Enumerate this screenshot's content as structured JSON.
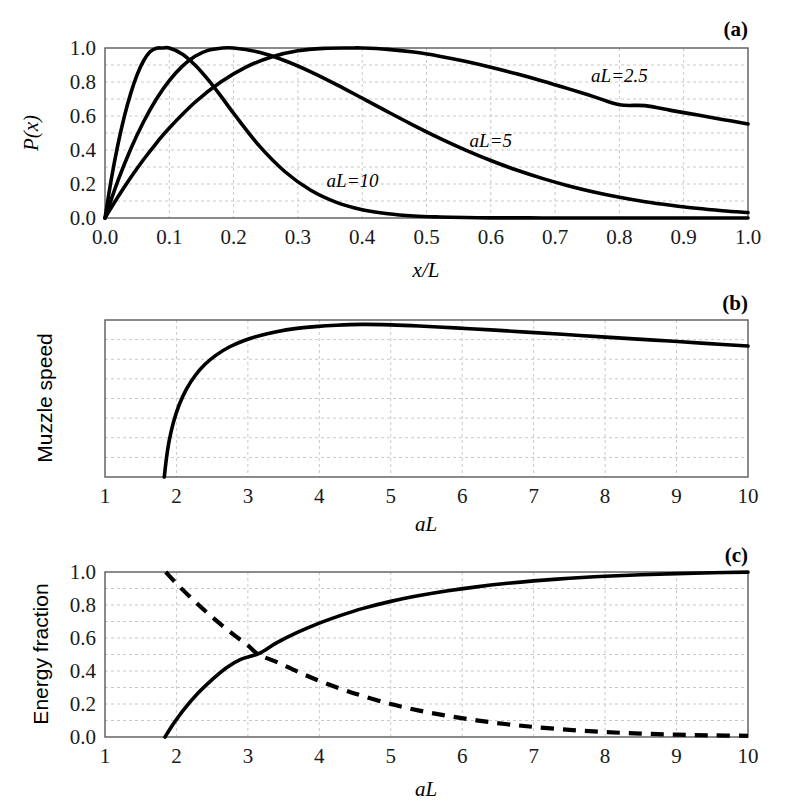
{
  "figure": {
    "title": "",
    "panel_count": 3,
    "background": "#ffffff",
    "curve_color": "#000000",
    "grid_color": "#c9c9c9",
    "frame_color": "#5a5a5a"
  },
  "panels": {
    "a": {
      "label": "(a)",
      "xlabel": "x/L",
      "ylabel": "P(x)",
      "curve_labels": [
        {
          "text": "aL=2.5",
          "x": 0.8,
          "y": 0.8
        },
        {
          "text": "aL=5",
          "x": 0.6,
          "y": 0.42
        },
        {
          "text": "aL=10",
          "x": 0.385,
          "y": 0.185
        }
      ]
    },
    "b": {
      "label": "(b)",
      "xlabel": "aL",
      "ylabel": "Muzzle speed"
    },
    "c": {
      "label": "(c)",
      "xlabel": "aL",
      "ylabel": "Energy fraction"
    }
  },
  "chart_data": [
    {
      "panel": "a",
      "type": "line",
      "title": "(a)",
      "xlabel": "x/L",
      "ylabel": "P(x)",
      "xlim": [
        0.0,
        1.0
      ],
      "ylim": [
        0.0,
        1.0
      ],
      "xticks": [
        0.0,
        0.1,
        0.2,
        0.3,
        0.4,
        0.5,
        0.6,
        0.7,
        0.8,
        0.9,
        1.0
      ],
      "xtick_labels": [
        "0.0",
        "0.1",
        "0.2",
        "0.3",
        "0.4",
        "0.5",
        "0.6",
        "0.7",
        "0.8",
        "0.9",
        "1.0"
      ],
      "yticks": [
        0.0,
        0.2,
        0.4,
        0.6,
        0.8,
        1.0
      ],
      "ytick_labels": [
        "0.0",
        "0.2",
        "0.4",
        "0.6",
        "0.8",
        "1.0"
      ],
      "grid": true,
      "grid_x_step": 0.1,
      "grid_y_step": 0.1,
      "legend": "inline-annotations",
      "series": [
        {
          "name": "aL=2.5",
          "peak_x": 0.4,
          "peak_y": 1.0,
          "x": [
            0.0,
            0.02,
            0.04,
            0.06,
            0.08,
            0.1,
            0.14,
            0.18,
            0.22,
            0.26,
            0.3,
            0.34,
            0.38,
            0.4,
            0.44,
            0.48,
            0.52,
            0.56,
            0.6,
            0.64,
            0.68,
            0.72,
            0.76,
            0.8,
            0.84,
            0.88,
            0.92,
            0.96,
            1.0
          ],
          "y": [
            0.0,
            0.123,
            0.238,
            0.344,
            0.441,
            0.53,
            0.681,
            0.8,
            0.889,
            0.949,
            0.984,
            0.998,
            1.0,
            1.0,
            0.992,
            0.976,
            0.952,
            0.922,
            0.887,
            0.848,
            0.806,
            0.761,
            0.714,
            0.666,
            0.661,
            0.633,
            0.607,
            0.58,
            0.553
          ]
        },
        {
          "name": "aL=5",
          "peak_x": 0.2,
          "peak_y": 1.0,
          "x": [
            0.0,
            0.02,
            0.04,
            0.06,
            0.08,
            0.1,
            0.12,
            0.14,
            0.16,
            0.18,
            0.2,
            0.24,
            0.28,
            0.32,
            0.36,
            0.4,
            0.44,
            0.48,
            0.52,
            0.56,
            0.6,
            0.64,
            0.68,
            0.72,
            0.76,
            0.8,
            0.84,
            0.88,
            0.92,
            0.96,
            1.0
          ],
          "y": [
            0.0,
            0.218,
            0.406,
            0.566,
            0.7,
            0.808,
            0.892,
            0.951,
            0.986,
            0.999,
            1.0,
            0.975,
            0.925,
            0.86,
            0.785,
            0.705,
            0.624,
            0.545,
            0.47,
            0.401,
            0.338,
            0.282,
            0.233,
            0.19,
            0.153,
            0.122,
            0.096,
            0.075,
            0.057,
            0.043,
            0.032
          ]
        },
        {
          "name": "aL=10",
          "peak_x": 0.1,
          "peak_y": 1.0,
          "x": [
            0.0,
            0.01,
            0.02,
            0.03,
            0.04,
            0.05,
            0.06,
            0.07,
            0.08,
            0.09,
            0.1,
            0.12,
            0.14,
            0.16,
            0.18,
            0.2,
            0.24,
            0.28,
            0.32,
            0.36,
            0.4,
            0.44,
            0.48,
            0.52,
            0.56,
            0.6,
            0.64,
            0.68,
            0.72,
            0.76,
            0.8,
            0.86,
            0.92,
            1.0
          ],
          "y": [
            0.0,
            0.232,
            0.43,
            0.596,
            0.733,
            0.843,
            0.925,
            0.978,
            0.999,
            1.0,
            1.0,
            0.965,
            0.9,
            0.815,
            0.718,
            0.616,
            0.424,
            0.272,
            0.163,
            0.092,
            0.049,
            0.025,
            0.012,
            0.006,
            0.003,
            0.001,
            0.001,
            0.0,
            0.0,
            0.0,
            0.0,
            0.0,
            0.0,
            0.0
          ]
        }
      ]
    },
    {
      "panel": "b",
      "type": "line",
      "title": "(b)",
      "xlabel": "aL",
      "ylabel": "Muzzle speed",
      "xlim": [
        1,
        10
      ],
      "ylim": [
        0,
        1
      ],
      "xticks": [
        1,
        2,
        3,
        4,
        5,
        6,
        7,
        8,
        9,
        10
      ],
      "xtick_labels": [
        "1",
        "2",
        "3",
        "4",
        "5",
        "6",
        "7",
        "8",
        "9",
        "10"
      ],
      "yticks": [],
      "ytick_labels": [],
      "grid": true,
      "grid_x_step": 1,
      "grid_y_count": 7,
      "series": [
        {
          "name": "muzzle-speed",
          "x_start": 1.83,
          "peak_x": 4.6,
          "x": [
            1.83,
            1.86,
            1.9,
            1.96,
            2.04,
            2.14,
            2.26,
            2.4,
            2.56,
            2.74,
            2.94,
            3.16,
            3.4,
            3.66,
            3.94,
            4.24,
            4.6,
            5.0,
            5.4,
            5.9,
            6.4,
            6.9,
            7.4,
            7.9,
            8.4,
            8.9,
            9.4,
            10.0
          ],
          "y": [
            0.0,
            0.12,
            0.235,
            0.352,
            0.462,
            0.56,
            0.645,
            0.718,
            0.778,
            0.828,
            0.868,
            0.9,
            0.925,
            0.945,
            0.958,
            0.967,
            0.972,
            0.969,
            0.962,
            0.95,
            0.937,
            0.923,
            0.909,
            0.894,
            0.88,
            0.866,
            0.851,
            0.834
          ]
        }
      ]
    },
    {
      "panel": "c",
      "type": "line",
      "title": "(c)",
      "xlabel": "aL",
      "ylabel": "Energy fraction",
      "xlim": [
        1,
        10
      ],
      "ylim": [
        0.0,
        1.0
      ],
      "xticks": [
        1,
        2,
        3,
        4,
        5,
        6,
        7,
        8,
        9,
        10
      ],
      "xtick_labels": [
        "1",
        "2",
        "3",
        "4",
        "5",
        "6",
        "7",
        "8",
        "9",
        "10"
      ],
      "yticks": [
        0.0,
        0.2,
        0.4,
        0.6,
        0.8,
        1.0
      ],
      "ytick_labels": [
        "0.0",
        "0.2",
        "0.4",
        "0.6",
        "0.8",
        "1.0"
      ],
      "grid": true,
      "grid_x_step": 1,
      "grid_y_step": 0.1,
      "crossing_point": {
        "x": 3.15,
        "y": 0.5
      },
      "series": [
        {
          "name": "useful-energy-fraction",
          "style": "solid",
          "x": [
            1.84,
            1.95,
            2.1,
            2.3,
            2.5,
            2.7,
            2.9,
            3.15,
            3.4,
            3.7,
            4.0,
            4.3,
            4.6,
            5.0,
            5.4,
            5.8,
            6.2,
            6.6,
            7.0,
            7.5,
            8.0,
            8.5,
            9.0,
            9.5,
            10.0
          ],
          "y": [
            0.0,
            0.075,
            0.165,
            0.265,
            0.348,
            0.42,
            0.47,
            0.505,
            0.57,
            0.635,
            0.69,
            0.737,
            0.778,
            0.822,
            0.857,
            0.886,
            0.91,
            0.93,
            0.946,
            0.962,
            0.974,
            0.983,
            0.99,
            0.995,
            0.999
          ]
        },
        {
          "name": "lost-energy-fraction",
          "style": "dashed",
          "x": [
            1.85,
            2.0,
            2.2,
            2.4,
            2.6,
            2.8,
            3.0,
            3.15,
            3.4,
            3.7,
            4.0,
            4.3,
            4.6,
            5.0,
            5.4,
            5.8,
            6.2,
            6.6,
            7.0,
            7.5,
            8.0,
            8.5,
            9.0,
            9.5,
            10.0
          ],
          "y": [
            1.0,
            0.93,
            0.845,
            0.765,
            0.69,
            0.62,
            0.555,
            0.5,
            0.455,
            0.395,
            0.34,
            0.292,
            0.25,
            0.2,
            0.16,
            0.128,
            0.101,
            0.079,
            0.061,
            0.043,
            0.03,
            0.021,
            0.014,
            0.01,
            0.007
          ]
        }
      ]
    }
  ]
}
